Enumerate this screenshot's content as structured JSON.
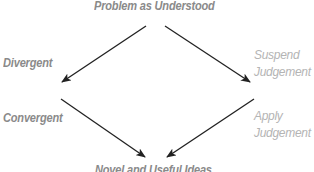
{
  "diagram": {
    "top_label": "Problem as Understood",
    "left_labels": {
      "divergent": "Divergent",
      "convergent": "Convergent"
    },
    "right_labels": {
      "suspend_line1": "Suspend",
      "suspend_line2": "Judgement",
      "apply_line1": "Apply",
      "apply_line2": "Judgement"
    },
    "bottom_label": "Novel and Useful Ideas",
    "colors": {
      "bold_text": "#8a8a8a",
      "light_text": "#b4b4b4",
      "arrow": "#222222"
    },
    "arrows": [
      {
        "from": "Problem as Understood",
        "to": "Divergent"
      },
      {
        "from": "Problem as Understood",
        "to": "Suspend Judgement"
      },
      {
        "from": "Convergent",
        "to": "Novel and Useful Ideas"
      },
      {
        "from": "Apply Judgement",
        "to": "Novel and Useful Ideas"
      }
    ]
  }
}
